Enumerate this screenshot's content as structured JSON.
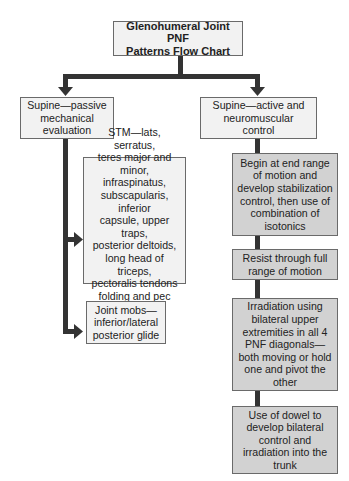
{
  "title": {
    "line1": "Glenohumeral Joint PNF",
    "line2": "Patterns Flow Chart"
  },
  "branches": {
    "left": {
      "label": [
        "Supine—passive",
        "mechanical",
        "evaluation"
      ],
      "children": [
        {
          "lines": [
            "STM—lats, serratus,",
            "teres major and minor,",
            "infraspinatus,",
            "subscapularis, inferior",
            "capsule, upper traps,",
            "posterior deltoids,",
            "long head of triceps,",
            "pectoralis tendons",
            "folding and pec minor"
          ]
        },
        {
          "lines": [
            "Joint mobs—",
            "inferior/lateral",
            "posterior glide"
          ]
        }
      ]
    },
    "right": {
      "label": [
        "Supine—active and",
        "neuromuscular",
        "control"
      ],
      "children": [
        {
          "lines": [
            "Begin at end range",
            "of motion and",
            "develop stabilization",
            "control, then use of",
            "combination of",
            "isotonics"
          ]
        },
        {
          "lines": [
            "Resist through full",
            "range of motion"
          ]
        },
        {
          "lines": [
            "Irradiation using",
            "bilateral upper",
            "extremities in all 4",
            "PNF diagonals—",
            "both moving or hold",
            "one and pivot the",
            "other"
          ]
        },
        {
          "lines": [
            "Use of dowel to",
            "develop bilateral",
            "control and",
            "irradiation into the",
            "trunk"
          ]
        }
      ]
    }
  },
  "colors": {
    "light_box": "#f2f2f2",
    "gray_box": "#d2d2d2",
    "connector": "#333333",
    "border": "#6a6a6a"
  }
}
